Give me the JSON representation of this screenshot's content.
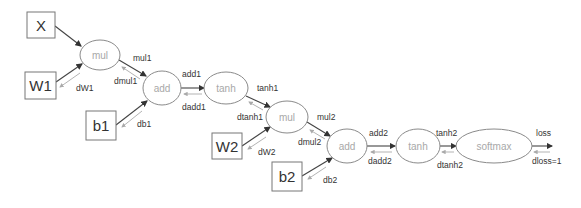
{
  "diagram": {
    "inputs": [
      {
        "id": "X",
        "label": "X",
        "x": 27,
        "y": 12,
        "w": 28,
        "h": 26
      },
      {
        "id": "W1",
        "label": "W1",
        "x": 25,
        "y": 72,
        "w": 31,
        "h": 27
      },
      {
        "id": "b1",
        "label": "b1",
        "x": 86,
        "y": 111,
        "w": 30,
        "h": 29
      },
      {
        "id": "W2",
        "label": "W2",
        "x": 212,
        "y": 133,
        "w": 30,
        "h": 26
      },
      {
        "id": "b2",
        "label": "b2",
        "x": 272,
        "y": 162,
        "w": 30,
        "h": 29
      }
    ],
    "ops": [
      {
        "id": "mul1",
        "label": "mul",
        "cx": 100,
        "cy": 55,
        "rx": 20,
        "ry": 15
      },
      {
        "id": "add1",
        "label": "add",
        "cx": 162,
        "cy": 88,
        "rx": 19,
        "ry": 17
      },
      {
        "id": "tanh1",
        "label": "tanh",
        "cx": 227,
        "cy": 88,
        "rx": 22,
        "ry": 16
      },
      {
        "id": "mul2",
        "label": "mul",
        "cx": 287,
        "cy": 117,
        "rx": 21,
        "ry": 16
      },
      {
        "id": "add2",
        "label": "add",
        "cx": 347,
        "cy": 146,
        "rx": 20,
        "ry": 17
      },
      {
        "id": "tanh2",
        "label": "tanh",
        "cx": 418,
        "cy": 146,
        "rx": 22,
        "ry": 17
      },
      {
        "id": "softmax",
        "label": "softmax",
        "cx": 494,
        "cy": 146,
        "rx": 38,
        "ry": 17
      }
    ],
    "edges": [
      {
        "from": "X",
        "to": "mul1",
        "fwd": "",
        "bwd": "",
        "fwd_pos": null,
        "bwd_pos": null
      },
      {
        "from": "W1",
        "to": "mul1",
        "fwd": "",
        "bwd": "dW1",
        "fwd_pos": null,
        "bwd_pos": [
          76,
          89
        ]
      },
      {
        "from": "mul1",
        "to": "add1",
        "fwd": "mul1",
        "bwd": "dmul1",
        "fwd_pos": [
          133,
          59
        ],
        "bwd_pos": [
          114,
          82
        ]
      },
      {
        "from": "b1",
        "to": "add1",
        "fwd": "",
        "bwd": "db1",
        "fwd_pos": null,
        "bwd_pos": [
          137,
          125
        ]
      },
      {
        "from": "add1",
        "to": "tanh1",
        "fwd": "add1",
        "bwd": "dadd1",
        "fwd_pos": [
          182,
          76
        ],
        "bwd_pos": [
          182,
          109
        ]
      },
      {
        "from": "tanh1",
        "to": "mul2",
        "fwd": "tanh1",
        "bwd": "dtanh1",
        "fwd_pos": [
          258,
          89
        ],
        "bwd_pos": [
          237,
          118
        ]
      },
      {
        "from": "W2",
        "to": "mul2",
        "fwd": "",
        "bwd": "dW2",
        "fwd_pos": null,
        "bwd_pos": [
          258,
          153
        ]
      },
      {
        "from": "mul2",
        "to": "add2",
        "fwd": "mul2",
        "bwd": "dmul2",
        "fwd_pos": [
          317,
          118
        ],
        "bwd_pos": [
          298,
          143
        ]
      },
      {
        "from": "b2",
        "to": "add2",
        "fwd": "",
        "bwd": "db2",
        "fwd_pos": null,
        "bwd_pos": [
          323,
          181
        ]
      },
      {
        "from": "add2",
        "to": "tanh2",
        "fwd": "add2",
        "bwd": "dadd2",
        "fwd_pos": [
          370,
          134
        ],
        "bwd_pos": [
          368,
          162
        ]
      },
      {
        "from": "tanh2",
        "to": "softmax",
        "fwd": "tanh2",
        "bwd": "dtanh2",
        "fwd_pos": [
          436,
          134
        ],
        "bwd_pos": [
          437,
          166
        ]
      },
      {
        "from": "softmax",
        "to": "loss",
        "fwd": "loss",
        "bwd": "dloss=1",
        "fwd_pos": [
          536,
          134
        ],
        "bwd_pos": [
          532,
          162
        ]
      }
    ]
  }
}
